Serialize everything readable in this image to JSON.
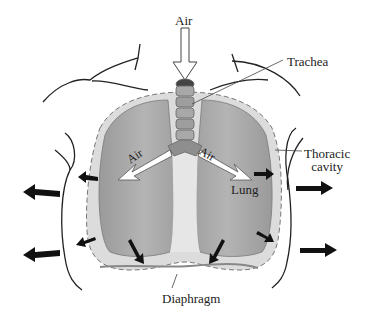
{
  "diagram": {
    "labels": {
      "air_top": "Air",
      "trachea": "Trachea",
      "thoracic_line1": "Thoracic",
      "thoracic_line2": "cavity",
      "air_left": "Air",
      "air_right": "Air",
      "lung": "Lung",
      "diaphragm": "Diaphragm"
    },
    "colors": {
      "lung_fill": "#a8a8a8",
      "lung_dark": "#8e8e8e",
      "pleura_fill": "#d9d9d9",
      "trachea_fill": "#9a9a9a",
      "outline": "#222222",
      "arrow": "#111111"
    },
    "arrows": {
      "inflow_top": "white-arrow-down",
      "inflow_bronchi": [
        "white-arrow-left-down",
        "white-arrow-right-down"
      ],
      "expansion_outward_count": 4,
      "expansion_inner_count": 6
    }
  }
}
